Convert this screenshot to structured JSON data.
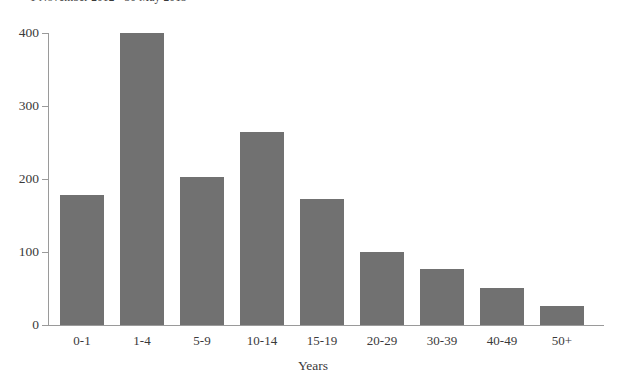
{
  "chart_data": {
    "type": "bar",
    "title": "1 November 2012 - 30 May 2013",
    "xlabel": "Years",
    "ylabel": "",
    "categories": [
      "0-1",
      "1-4",
      "5-9",
      "10-14",
      "15-19",
      "20-29",
      "30-39",
      "40-49",
      "50+"
    ],
    "values": [
      178,
      400,
      203,
      265,
      172,
      100,
      77,
      51,
      26
    ],
    "ylim": [
      0,
      400
    ],
    "yticks": [
      0,
      100,
      200,
      300,
      400
    ],
    "ytick_labels": [
      "0",
      "100",
      "200",
      "300",
      "400"
    ],
    "grid": false,
    "legend": null,
    "bar_color": "#717171",
    "axis_color": "#9a9a9a",
    "text_color": "#3a3a3a"
  }
}
